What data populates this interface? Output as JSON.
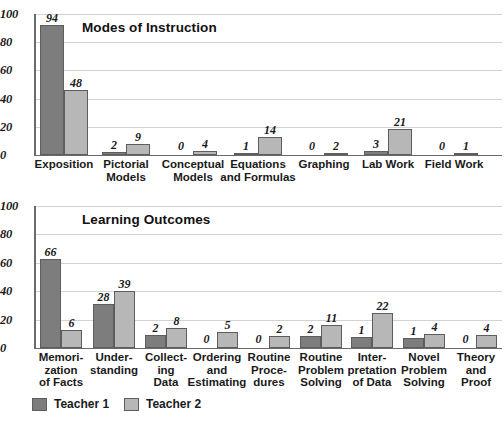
{
  "legend": {
    "entries": [
      {
        "label": "Teacher 1",
        "color": "#7d7d7d"
      },
      {
        "label": "Teacher 2",
        "color": "#b7b7b7"
      }
    ]
  },
  "chart_data": [
    {
      "type": "bar",
      "title": "Modes of Instruction",
      "xlabel": "",
      "ylabel": "",
      "ylim": [
        0,
        100
      ],
      "yticks": [
        0,
        20,
        40,
        60,
        80,
        100
      ],
      "grid": true,
      "legend_position": "bottom-left",
      "categories": [
        "Exposition",
        "Pictorial\nModels",
        "Conceptual\nModels",
        "Equations\nand Formulas",
        "Graphing",
        "Lab Work",
        "Field Work"
      ],
      "series": [
        {
          "name": "Teacher 1",
          "color": "#7d7d7d",
          "values": [
            94,
            2,
            0,
            1,
            0,
            3,
            0
          ],
          "plotted": [
            92,
            2,
            0,
            1,
            0,
            2.5,
            0
          ]
        },
        {
          "name": "Teacher 2",
          "color": "#b7b7b7",
          "values": [
            48,
            9,
            4,
            14,
            2,
            21,
            1
          ],
          "plotted": [
            46,
            8,
            3,
            12.5,
            1,
            18.5,
            0.8
          ]
        }
      ]
    },
    {
      "type": "bar",
      "title": "Learning Outcomes",
      "xlabel": "",
      "ylabel": "",
      "ylim": [
        0,
        100
      ],
      "yticks": [
        0,
        20,
        40,
        60,
        80,
        100
      ],
      "grid": true,
      "legend_position": "bottom-left",
      "categories": [
        "Memori-\nzation\nof Facts",
        "Under-\nstanding",
        "Collect-\ning\nData",
        "Ordering\nand\nEstimating",
        "Routine\nProce-\ndures",
        "Routine\nProblem\nSolving",
        "Inter-\npretation\nof Data",
        "Novel\nProblem\nSolving",
        "Theory\nand\nProof"
      ],
      "series": [
        {
          "name": "Teacher 1",
          "color": "#7d7d7d",
          "values": [
            66,
            28,
            2,
            0,
            0,
            2,
            1,
            1,
            0
          ],
          "plotted": [
            63,
            31,
            9,
            0,
            0,
            8.5,
            7.5,
            7,
            0
          ]
        },
        {
          "name": "Teacher 2",
          "color": "#b7b7b7",
          "values": [
            6,
            39,
            8,
            5,
            2,
            11,
            22,
            4,
            4
          ],
          "plotted": [
            13,
            40,
            14,
            11.5,
            8.5,
            16,
            25,
            10,
            9.5
          ]
        }
      ]
    }
  ]
}
